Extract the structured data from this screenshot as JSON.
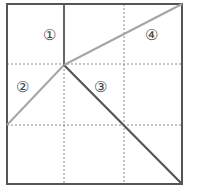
{
  "diagram": {
    "grid": {
      "rows": 3,
      "cols": 3,
      "style": "dotted"
    },
    "regions": [
      {
        "id": "1",
        "label": "①"
      },
      {
        "id": "2",
        "label": "②"
      },
      {
        "id": "3",
        "label": "③"
      },
      {
        "id": "4",
        "label": "④"
      }
    ],
    "colors": {
      "border": "#555555",
      "grid": "#888888",
      "segment_dark": "#555555",
      "segment_light": "#a0a0a0"
    }
  }
}
